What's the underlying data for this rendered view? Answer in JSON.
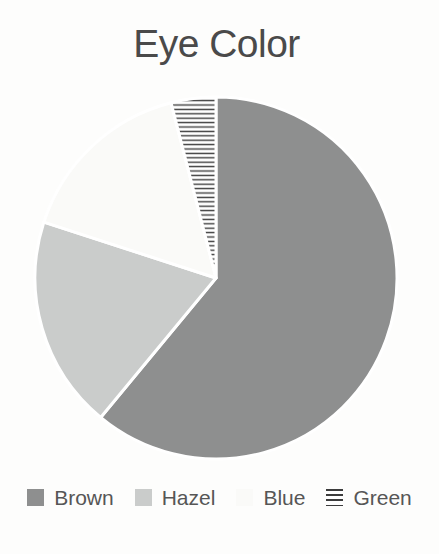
{
  "title": "Eye Color",
  "chart_data": {
    "type": "pie",
    "title": "Eye Color",
    "categories": [
      "Brown",
      "Hazel",
      "Blue",
      "Green"
    ],
    "values": [
      61,
      19,
      16,
      4
    ],
    "start_angle_deg": 0,
    "direction": "clockwise",
    "slice_colors": [
      "#8e8f8f",
      "#cacccb",
      "#fafaf8",
      "hatch-horizontal"
    ],
    "slice_border_color": "#ffffff",
    "hatch": {
      "line_color": "#3c3c3c",
      "bg": "#ffffff"
    },
    "legend_position": "bottom",
    "text_colors": {
      "title": "#4a4a4a",
      "legend": "#565656"
    }
  }
}
